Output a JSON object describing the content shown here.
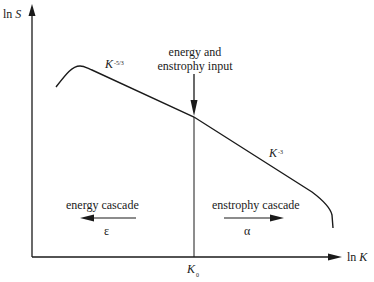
{
  "diagram": {
    "title": "",
    "type": "spectrum-schematic",
    "y_axis": {
      "label_prefix": "ln ",
      "label_var": "S"
    },
    "x_axis": {
      "label_prefix": "ln ",
      "label_var": "K"
    },
    "marker": {
      "var": "K",
      "sub": "0"
    },
    "input_label": {
      "line1": "energy and",
      "line2": "enstrophy input"
    },
    "slope_left": {
      "base": "K",
      "exp": "-5/3"
    },
    "slope_right": {
      "base": "K",
      "exp": "-3"
    },
    "left_cascade": {
      "label": "energy cascade",
      "symbol": "ε",
      "direction": "left"
    },
    "right_cascade": {
      "label": "enstrophy cascade",
      "symbol": "α",
      "direction": "right"
    },
    "colors": {
      "line": "#1a1a1a",
      "background": "#ffffff"
    }
  }
}
